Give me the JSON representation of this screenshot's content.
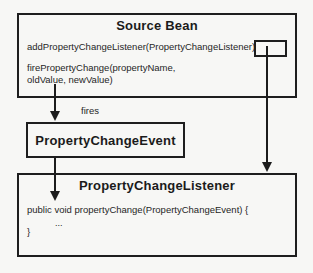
{
  "diagram": {
    "source_bean": {
      "title": "Source Bean",
      "add_listener_method": "addPropertyChangeListener(PropertyChangeListener)",
      "fire_method_line1": "firePropertyChange(propertyName,",
      "fire_method_line2": "oldValue, newValue)",
      "creates_note": {
        "line1": "creates",
        "line2": "reference to",
        "line3": "listener"
      }
    },
    "fires_label": "fires",
    "event_box": {
      "title": "PropertyChangeEvent"
    },
    "listener_box": {
      "title": "PropertyChangeListener",
      "code_line1": "public void propertyChange(PropertyChangeEvent) {",
      "code_line2": "...",
      "code_line3": "}"
    },
    "colors": {
      "background": "#f7f7f5",
      "line": "#1c1c1c",
      "text": "#262626"
    }
  }
}
